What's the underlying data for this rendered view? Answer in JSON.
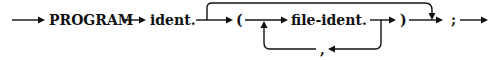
{
  "diagram": {
    "type": "syntax-diagram",
    "nodes": {
      "program": "PROGRAM",
      "ident": "ident.",
      "lparen": "(",
      "file_ident": "file-ident.",
      "rparen": ")",
      "semicolon": ";",
      "comma": ","
    },
    "edges": [
      {
        "from": "start",
        "to": "PROGRAM"
      },
      {
        "from": "PROGRAM",
        "to": "ident."
      },
      {
        "from": "ident.",
        "to": "("
      },
      {
        "from": "ident.",
        "to": ";",
        "kind": "bypass-over"
      },
      {
        "from": "(",
        "to": "file-ident."
      },
      {
        "from": "file-ident.",
        "to": ")"
      },
      {
        "from": "file-ident.",
        "to": ",",
        "kind": "loop-back"
      },
      {
        "from": ",",
        "to": "file-ident.",
        "kind": "loop-back"
      },
      {
        "from": ")",
        "to": ";"
      },
      {
        "from": ";",
        "to": "end"
      }
    ]
  }
}
